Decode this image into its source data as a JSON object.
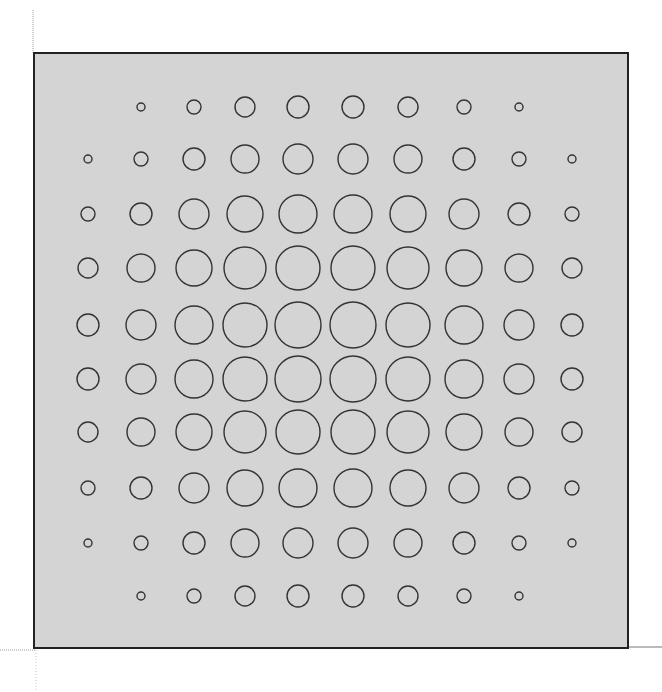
{
  "figure": {
    "colors": {
      "background": "#ffffff",
      "panel_fill": "#d4d4d4",
      "panel_border": "#222222",
      "circle_stroke": "#333333",
      "guide_line": "#9a9a9a"
    },
    "panel": {
      "x": 34,
      "y": 53,
      "width": 594,
      "height": 595
    },
    "grid": {
      "rows": 10,
      "cols": 10,
      "col_x": [
        88,
        141,
        194,
        245,
        298,
        353,
        408,
        464,
        519,
        572
      ],
      "row_y": [
        107,
        159,
        214,
        268,
        325,
        379,
        432,
        488,
        543,
        596
      ],
      "radii": [
        [
          0,
          4,
          7,
          10,
          11,
          11,
          10,
          7,
          4,
          0
        ],
        [
          4,
          7,
          11,
          14,
          15,
          15,
          14,
          11,
          7,
          4
        ],
        [
          7,
          11,
          15,
          18,
          19,
          19,
          18,
          15,
          11,
          7
        ],
        [
          10,
          14,
          18,
          21,
          22,
          22,
          21,
          18,
          14,
          10
        ],
        [
          11,
          15,
          19,
          22,
          23,
          23,
          22,
          19,
          15,
          11
        ],
        [
          11,
          15,
          19,
          22,
          23,
          23,
          22,
          19,
          15,
          11
        ],
        [
          10,
          14,
          18,
          21,
          22,
          22,
          21,
          18,
          14,
          10
        ],
        [
          7,
          11,
          15,
          18,
          19,
          19,
          18,
          15,
          11,
          7
        ],
        [
          4,
          7,
          11,
          14,
          15,
          15,
          14,
          11,
          7,
          4
        ],
        [
          0,
          4,
          7,
          10,
          11,
          11,
          10,
          7,
          4,
          0
        ]
      ]
    }
  }
}
